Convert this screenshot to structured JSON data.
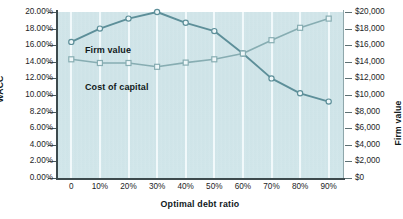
{
  "chart_data": {
    "type": "line",
    "title": "",
    "xlabel": "Optimal debt ratio",
    "ylabel": "WACC",
    "y2label": "Firm value",
    "categories": [
      "0",
      "10%",
      "20%",
      "30%",
      "40%",
      "50%",
      "60%",
      "70%",
      "80%",
      "90%"
    ],
    "x_tick_labels": [
      "0",
      "10%",
      "20%",
      "30%",
      "40%",
      "50%",
      "60%",
      "70%",
      "80%",
      "90%"
    ],
    "y_tick_labels": [
      "20.00%",
      "18.00%",
      "16.00%",
      "14.00%",
      "12.00%",
      "10.00%",
      "8.20%",
      "6.00%",
      "4.00%",
      "2.00%",
      "0.00%"
    ],
    "y_tick_values": [
      20,
      18,
      16,
      14,
      12,
      10,
      8,
      6,
      4,
      2,
      0
    ],
    "y2_tick_labels": [
      "$20,000",
      "$18,000",
      "$16,000",
      "$14,000",
      "$12,000",
      "$10,000",
      "$8,000",
      "$6,000",
      "$4,000",
      "$2,000",
      "$0"
    ],
    "y2_tick_values": [
      20000,
      18000,
      16000,
      14000,
      12000,
      10000,
      8000,
      6000,
      4000,
      2000,
      0
    ],
    "ylim": [
      0,
      20
    ],
    "y2lim": [
      0,
      20000
    ],
    "grid": "vertical-only",
    "legend": "inline-labels",
    "background_color": "#cfe4e8",
    "gridline_color": "#f2fafc",
    "series": [
      {
        "name": "Firm value",
        "axis": "right",
        "marker": "circle",
        "color": "#5d8f99",
        "values": [
          16400,
          18000,
          19200,
          20000,
          18700,
          17700,
          15000,
          12000,
          10200,
          9200
        ]
      },
      {
        "name": "Cost of capital",
        "axis": "left",
        "marker": "square",
        "color": "#87adb2",
        "values": [
          14.3,
          13.85,
          13.85,
          13.4,
          13.9,
          14.3,
          15.0,
          16.6,
          18.1,
          19.2
        ]
      }
    ],
    "annotations": [
      {
        "text": "Firm value",
        "name": "firm-value-label"
      },
      {
        "text": "Cost of capital",
        "name": "cost-of-capital-label"
      }
    ]
  }
}
